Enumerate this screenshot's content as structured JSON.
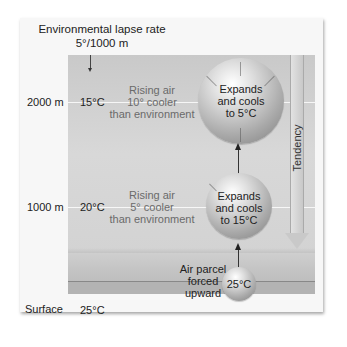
{
  "title": {
    "line1": "Environmental lapse rate",
    "line2": "5°/1000 m"
  },
  "altitudes": [
    {
      "label": "2000 m",
      "env_temp": "15°C"
    },
    {
      "label": "1000 m",
      "env_temp": "20°C"
    },
    {
      "label": "Surface",
      "env_temp": "25°C"
    }
  ],
  "rising_air_notes": [
    {
      "line1": "Rising air",
      "line2": "10° cooler",
      "line3": "than environment"
    },
    {
      "line1": "Rising air",
      "line2": "5° cooler",
      "line3": "than environment"
    }
  ],
  "parcels": [
    {
      "line1": "Expands",
      "line2": "and cools",
      "line3": "to 5°C"
    },
    {
      "line1": "Expands",
      "line2": "and cools",
      "line3": "to 15°C"
    },
    {
      "label": "25°C"
    }
  ],
  "forced_label": {
    "line1": "Air parcel",
    "line2": "forced",
    "line3": "upward"
  },
  "tendency_label": "Tendency",
  "colors": {
    "background": "#ffffff",
    "card": "#f7f7f7",
    "sky": "#d2d2d2",
    "ground": "#bdbdbd",
    "text": "#222222",
    "muted_text": "#6a6a6a"
  }
}
